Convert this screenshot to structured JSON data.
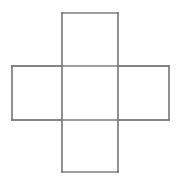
{
  "figure": {
    "name": "cross-shaped-grid-figure",
    "background_color": "#ffffff",
    "line_color": "#6b6b6b",
    "line_color_secondary": "#7d7d7d",
    "line_width": 1.5,
    "canvas": {
      "width": 184,
      "height": 182
    },
    "geometry": {
      "vertical_bar": {
        "x": 62,
        "y": 13,
        "width": 56,
        "height": 159
      },
      "horizontal_bar": {
        "x": 12,
        "y": 66,
        "width": 157,
        "height": 54
      },
      "center_x_left": 62,
      "center_x_right": 118,
      "center_y_top": 66,
      "center_y_bottom": 120
    },
    "cells": [
      {
        "name": "top-cell",
        "x": 62,
        "y": 13,
        "width": 56,
        "height": 53
      },
      {
        "name": "left-cell",
        "x": 12,
        "y": 66,
        "width": 50,
        "height": 54
      },
      {
        "name": "center-cell",
        "x": 62,
        "y": 66,
        "width": 56,
        "height": 54
      },
      {
        "name": "right-cell",
        "x": 118,
        "y": 66,
        "width": 51,
        "height": 54
      },
      {
        "name": "bottom-cell",
        "x": 62,
        "y": 120,
        "width": 56,
        "height": 52
      }
    ],
    "segments": [
      {
        "name": "top-edge",
        "x1": 62,
        "y1": 13,
        "x2": 118,
        "y2": 13
      },
      {
        "name": "bottom-edge",
        "x1": 62,
        "y1": 172,
        "x2": 118,
        "y2": 172
      },
      {
        "name": "left-edge",
        "x1": 12,
        "y1": 66,
        "x2": 12,
        "y2": 120
      },
      {
        "name": "right-edge",
        "x1": 169,
        "y1": 66,
        "x2": 169,
        "y2": 120
      },
      {
        "name": "upper-left-arm-edge",
        "x1": 12,
        "y1": 66,
        "x2": 62,
        "y2": 66
      },
      {
        "name": "upper-right-arm-edge",
        "x1": 118,
        "y1": 66,
        "x2": 169,
        "y2": 66
      },
      {
        "name": "lower-left-arm-edge",
        "x1": 12,
        "y1": 120,
        "x2": 62,
        "y2": 120
      },
      {
        "name": "lower-right-arm-edge",
        "x1": 118,
        "y1": 120,
        "x2": 169,
        "y2": 120
      },
      {
        "name": "vertical-left-rail",
        "x1": 62,
        "y1": 13,
        "x2": 62,
        "y2": 172
      },
      {
        "name": "vertical-right-rail",
        "x1": 118,
        "y1": 13,
        "x2": 118,
        "y2": 172
      },
      {
        "name": "horizontal-top-rail",
        "x1": 12,
        "y1": 66,
        "x2": 169,
        "y2": 66
      },
      {
        "name": "horizontal-bottom-rail",
        "x1": 12,
        "y1": 120,
        "x2": 169,
        "y2": 120
      }
    ]
  },
  "chart_data": {
    "type": "diagram",
    "title": "",
    "shape": "cross",
    "cell_count": 5,
    "cell_labels": [
      "top",
      "left",
      "center",
      "right",
      "bottom"
    ],
    "annotations": []
  }
}
